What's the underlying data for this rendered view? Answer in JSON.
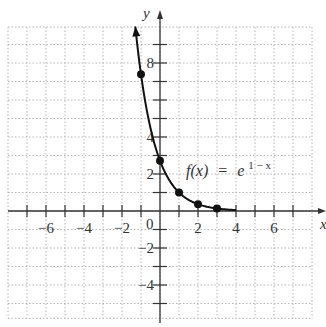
{
  "chart_data": {
    "type": "line",
    "title": "",
    "function_label": {
      "f": "f(x)",
      "equals": "=",
      "base": "e",
      "exponent": "1 − x"
    },
    "xlabel": "x",
    "ylabel": "y",
    "xlim": [
      -8,
      8
    ],
    "ylim": [
      -5.8,
      10
    ],
    "grid": true,
    "grid_style": "dotted",
    "x_ticks": [
      -7,
      -6,
      -5,
      -4,
      -3,
      -2,
      -1,
      1,
      2,
      3,
      4,
      5,
      6,
      7
    ],
    "x_tick_labels": [
      "-6",
      "-4",
      "-2",
      "2",
      "4",
      "6"
    ],
    "y_ticks": [
      -5,
      -4,
      -3,
      -2,
      -1,
      1,
      2,
      3,
      4,
      5,
      6,
      7,
      8,
      9
    ],
    "y_tick_labels": [
      "8",
      "4",
      "2",
      "-2",
      "-4"
    ],
    "origin_label": "0",
    "series": [
      {
        "name": "f(x) = e^(1 − x)",
        "points": [
          {
            "x": -1,
            "y": 7.39
          },
          {
            "x": 0,
            "y": 2.72
          },
          {
            "x": 1,
            "y": 1
          },
          {
            "x": 2,
            "y": 0.37
          },
          {
            "x": 3,
            "y": 0.14
          }
        ],
        "curve_domain": [
          -1.3,
          4
        ]
      }
    ]
  },
  "colors": {
    "curve": "#111111",
    "axis": "#333333",
    "grid": "#b5b5b5",
    "text": "#333333"
  }
}
